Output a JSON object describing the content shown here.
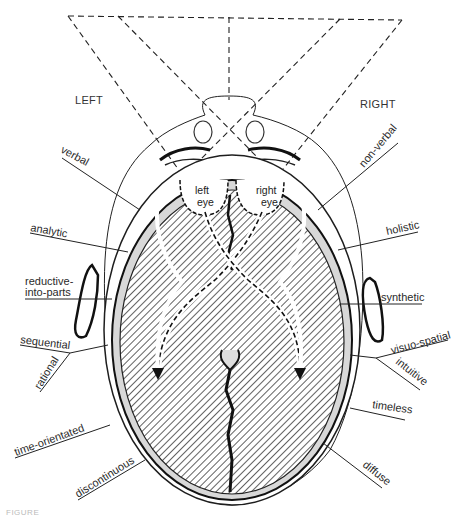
{
  "diagram": {
    "side_labels": {
      "left": "LEFT",
      "right": "RIGHT"
    },
    "eye_labels": {
      "left": [
        "left",
        "eye"
      ],
      "right": [
        "right",
        "eye"
      ]
    },
    "left_hemisphere_traits": [
      "verbal",
      "analytic",
      "reductive-",
      "into-parts",
      "sequential",
      "rational",
      "time-orientated",
      "discontinuous"
    ],
    "right_hemisphere_traits": [
      "non-verbal",
      "holistic",
      "synthetic",
      "visuo-spatial",
      "intuitive",
      "timeless",
      "diffuse"
    ],
    "caption_fragment": "FIGURE"
  },
  "colors": {
    "ink": "#1e1e1e",
    "hatch": "#3a3a3a",
    "background": "#ffffff"
  }
}
